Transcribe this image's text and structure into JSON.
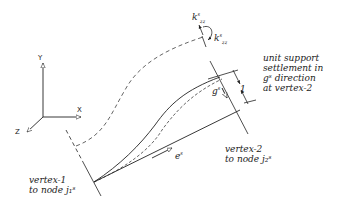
{
  "axes": {
    "x_label": "X",
    "y_label": "Y",
    "z_label": "Z"
  },
  "symbols": {
    "k_top": "k",
    "k_top_sup": "s",
    "k_top_sub": "zz",
    "k_right": "k",
    "k_right_sup": "s",
    "k_right_sub": "zz",
    "g": "g",
    "g_sup": "s",
    "e": "e",
    "e_sup": "s",
    "unit_value": "1"
  },
  "annotations": {
    "settlement_note": [
      "unit support",
      "settlement in",
      "gˢ direction",
      "at vertex-2"
    ],
    "vertex1": [
      "vertex-1",
      "to node j₁ˢ"
    ],
    "vertex2": [
      "vertex-2",
      "to node j₂ˢ"
    ]
  }
}
